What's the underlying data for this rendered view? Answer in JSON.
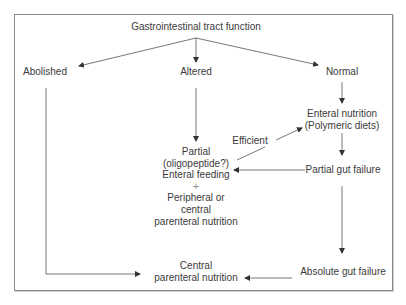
{
  "diagram": {
    "title": "Gastrointestinal tract function",
    "nodes": {
      "root": {
        "label": "Gastrointestinal tract function"
      },
      "abolished": {
        "label": "Abolished"
      },
      "altered": {
        "label": "Altered"
      },
      "normal": {
        "label": "Normal"
      },
      "enteral_nutrition": {
        "lines": [
          "Enteral nutrition",
          "(Polymeric diets)"
        ]
      },
      "partial_feeding": {
        "lines": [
          "Partial",
          "(oligopeptide?)",
          "Enteral feeding",
          "+",
          "Peripheral or",
          "central",
          "parenteral nutrition"
        ]
      },
      "partial_gut_failure": {
        "label": "Partial gut failure"
      },
      "absolute_gut_failure": {
        "label": "Absolute gut failure"
      },
      "central_parenteral": {
        "lines": [
          "Central",
          "parenteral nutrition"
        ]
      }
    },
    "edges": [
      {
        "from": "root",
        "to": "abolished"
      },
      {
        "from": "root",
        "to": "altered"
      },
      {
        "from": "root",
        "to": "normal"
      },
      {
        "from": "normal",
        "to": "enteral_nutrition"
      },
      {
        "from": "altered",
        "to": "partial_feeding"
      },
      {
        "from": "partial_feeding",
        "to": "enteral_nutrition",
        "label": "Efficient"
      },
      {
        "from": "enteral_nutrition",
        "to": "partial_gut_failure"
      },
      {
        "from": "partial_gut_failure",
        "to": "partial_feeding"
      },
      {
        "from": "partial_gut_failure",
        "to": "absolute_gut_failure"
      },
      {
        "from": "absolute_gut_failure",
        "to": "central_parenteral"
      },
      {
        "from": "abolished",
        "to": "central_parenteral"
      }
    ],
    "edge_label_efficient": "Efficient",
    "colors": {
      "line": "#555555",
      "text": "#3a3a3a",
      "border": "#8a8a8a"
    }
  }
}
